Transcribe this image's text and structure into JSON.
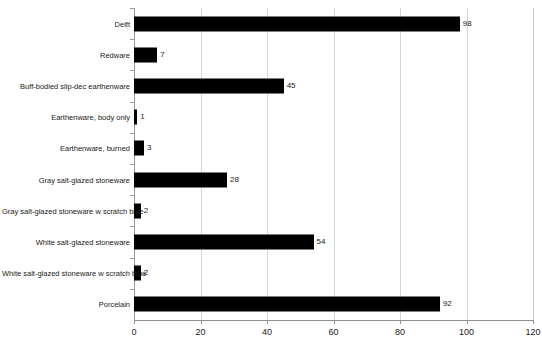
{
  "chart_data": {
    "type": "bar",
    "orientation": "horizontal",
    "title": "",
    "subtitle": "",
    "xlabel": "",
    "ylabel": "",
    "xlim": [
      0,
      120
    ],
    "xticks": [
      0,
      20,
      40,
      60,
      80,
      100,
      120
    ],
    "grid": "vertical",
    "legend": "none",
    "bar_color": "#000000",
    "gridline_color": "#d4d4d4",
    "axis_color": "#8f8f8f",
    "show_value_labels": true,
    "categories": [
      "Delft",
      "Redware",
      "Buff-bodied slip-dec earthenware",
      "Earthenware, body only",
      "Earthenware, burned",
      "Gray salt-glazed stoneware",
      "Gray salt-glazed stoneware w scratch blue",
      "White salt-glazed stoneware",
      "White salt-glazed stoneware w scratch blue",
      "Porcelain"
    ],
    "values": [
      98,
      7,
      45,
      1,
      3,
      28,
      2,
      54,
      2,
      92
    ],
    "value_labels": [
      "98",
      "7",
      "45",
      "1",
      "3",
      "28",
      "2",
      "54",
      "2",
      "92"
    ],
    "xtick_labels": [
      "0",
      "20",
      "40",
      "60",
      "80",
      "100",
      "120"
    ]
  }
}
